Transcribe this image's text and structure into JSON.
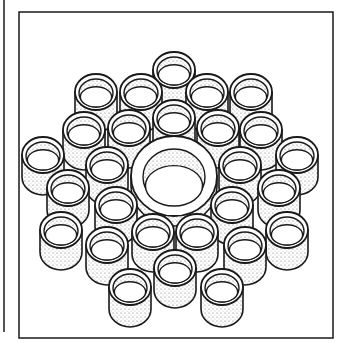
{
  "figure": {
    "colors": {
      "ink": "#1a1a1a",
      "paper": "#ffffff",
      "stipple": "#555555"
    },
    "frame": {
      "x": 19,
      "y": 12,
      "w": 314,
      "h": 326
    },
    "margin_rule": {
      "x": 4,
      "y1": 0,
      "y2": 332
    },
    "center_tube": {
      "cx": 174,
      "cy": 176,
      "rx": 43,
      "ry": 40,
      "inner_rx": 31,
      "inner_ry": 28
    },
    "tube_size": {
      "rx": 21,
      "ry": 18,
      "height": 22
    },
    "tubes": [
      {
        "cx": 174,
        "cy": 70
      },
      {
        "cx": 96,
        "cy": 92
      },
      {
        "cx": 141,
        "cy": 92
      },
      {
        "cx": 207,
        "cy": 92
      },
      {
        "cx": 251,
        "cy": 92
      },
      {
        "cx": 84,
        "cy": 130
      },
      {
        "cx": 129,
        "cy": 128
      },
      {
        "cx": 174,
        "cy": 118
      },
      {
        "cx": 218,
        "cy": 128
      },
      {
        "cx": 261,
        "cy": 130
      },
      {
        "cx": 43,
        "cy": 155
      },
      {
        "cx": 107,
        "cy": 165
      },
      {
        "cx": 240,
        "cy": 165
      },
      {
        "cx": 297,
        "cy": 155
      },
      {
        "cx": 68,
        "cy": 188
      },
      {
        "cx": 116,
        "cy": 205
      },
      {
        "cx": 232,
        "cy": 205
      },
      {
        "cx": 279,
        "cy": 188
      },
      {
        "cx": 61,
        "cy": 230
      },
      {
        "cx": 107,
        "cy": 245
      },
      {
        "cx": 153,
        "cy": 232
      },
      {
        "cx": 197,
        "cy": 232
      },
      {
        "cx": 245,
        "cy": 245
      },
      {
        "cx": 287,
        "cy": 230
      },
      {
        "cx": 130,
        "cy": 287
      },
      {
        "cx": 175,
        "cy": 268
      },
      {
        "cx": 222,
        "cy": 287
      }
    ]
  }
}
